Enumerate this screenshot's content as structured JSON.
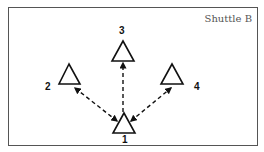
{
  "title": "Shuttle B",
  "cones": [
    {
      "id": "1",
      "label": "1"
    },
    {
      "id": "2",
      "label": "2"
    },
    {
      "id": "3",
      "label": "3"
    },
    {
      "id": "4",
      "label": "4"
    }
  ],
  "arrows": [
    {
      "from": "1",
      "to": "2",
      "style": "dashed",
      "direction": "both"
    },
    {
      "from": "1",
      "to": "3",
      "style": "dashed",
      "direction": "to"
    },
    {
      "from": "1",
      "to": "4",
      "style": "dashed",
      "direction": "both"
    }
  ]
}
